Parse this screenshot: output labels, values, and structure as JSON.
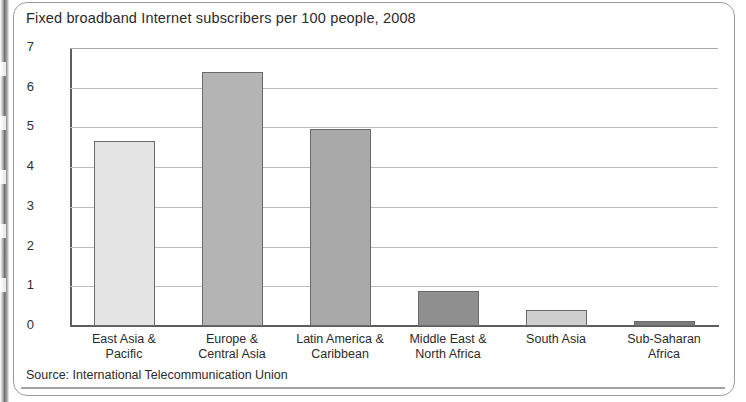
{
  "figure": {
    "title": "Fixed broadband Internet subscribers per 100 people, 2008",
    "source": "Source: International Telecommunication Union"
  },
  "chart_data": {
    "type": "bar",
    "title": "Fixed broadband Internet subscribers per 100 people, 2008",
    "xlabel": "",
    "ylabel": "",
    "ylim": [
      0,
      7
    ],
    "yticks": [
      "0",
      "1",
      "2",
      "3",
      "4",
      "5",
      "6",
      "7"
    ],
    "grid": true,
    "legend": "none",
    "categories": [
      "East Asia &\nPacific",
      "Europe &\nCentral Asia",
      "Latin America &\nCaribbean",
      "Middle East &\nNorth Africa",
      "South Asia",
      "Sub-Saharan\nAfrica"
    ],
    "values": [
      4.65,
      6.4,
      4.95,
      0.88,
      0.4,
      0.12
    ],
    "bar_colors": [
      "#e4e4e4",
      "#b4b4b4",
      "#a9a9a9",
      "#8f8f8f",
      "#cfcfcf",
      "#7c7c7c"
    ],
    "bar_edge_color": "#6a6a6a",
    "gridline_color": "#bdbdbd",
    "axis_color": "#5d5d5d"
  }
}
